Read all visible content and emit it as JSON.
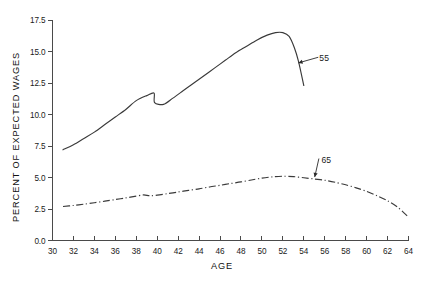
{
  "chart_data": {
    "type": "line",
    "title": "",
    "xlabel": "AGE",
    "ylabel": "PERCENT OF EXPECTED WAGES",
    "xlim": [
      30,
      64
    ],
    "ylim": [
      0.0,
      17.5
    ],
    "xticks": [
      30,
      32,
      34,
      36,
      38,
      40,
      42,
      44,
      46,
      48,
      50,
      52,
      54,
      56,
      58,
      60,
      62,
      64
    ],
    "xticklabels": [
      "30",
      "32",
      "34",
      "36",
      "38",
      "40",
      "42",
      "44",
      "46",
      "48",
      "50",
      "52",
      "54",
      "56",
      "58",
      "60",
      "62",
      "64"
    ],
    "yticks": [
      0.0,
      2.5,
      5.0,
      7.5,
      10.0,
      12.5,
      15.0,
      17.5
    ],
    "yticklabels": [
      "0.0",
      "2.5",
      "5.0",
      "7.5",
      "10.0",
      "12.5",
      "15.0",
      "17.5"
    ],
    "grid": false,
    "legend": "none",
    "series": [
      {
        "name": "55",
        "style": "solid",
        "label": "55",
        "x": [
          31.0,
          32.0,
          33.0,
          34.0,
          35.0,
          36.0,
          37.0,
          38.0,
          39.0,
          39.7,
          39.75,
          40.6,
          41.5,
          42.5,
          43.5,
          44.5,
          45.5,
          46.5,
          47.5,
          48.5,
          49.5,
          50.5,
          51.3,
          52.0,
          52.6,
          53.1,
          53.5,
          54.0
        ],
        "y": [
          7.2,
          7.6,
          8.1,
          8.6,
          9.2,
          9.8,
          10.4,
          11.1,
          11.5,
          11.7,
          10.95,
          10.8,
          11.3,
          11.9,
          12.5,
          13.1,
          13.7,
          14.3,
          14.9,
          15.4,
          15.9,
          16.3,
          16.5,
          16.5,
          16.2,
          15.3,
          14.2,
          12.3
        ]
      },
      {
        "name": "65",
        "style": "dashdot",
        "label": "65",
        "x": [
          31.0,
          32.0,
          33.0,
          34.0,
          35.0,
          36.0,
          37.0,
          38.0,
          38.7,
          39.3,
          40.0,
          41.0,
          42.0,
          43.0,
          44.0,
          45.0,
          46.0,
          47.0,
          48.0,
          49.0,
          50.0,
          51.0,
          52.0,
          53.0,
          54.0,
          55.0,
          56.0,
          57.0,
          58.0,
          59.0,
          60.0,
          61.0,
          62.0,
          63.0,
          64.0
        ],
        "y": [
          2.7,
          2.78,
          2.88,
          3.0,
          3.12,
          3.25,
          3.38,
          3.52,
          3.62,
          3.55,
          3.6,
          3.72,
          3.85,
          3.98,
          4.1,
          4.25,
          4.38,
          4.52,
          4.65,
          4.8,
          4.95,
          5.05,
          5.1,
          5.07,
          4.98,
          4.88,
          4.78,
          4.62,
          4.42,
          4.18,
          3.9,
          3.55,
          3.15,
          2.62,
          1.85
        ]
      }
    ],
    "annotations": [
      {
        "text": "55",
        "target_x": 53.3,
        "target_y": 14.05,
        "label_x": 55.2,
        "label_y": 14.5
      },
      {
        "text": "65",
        "target_x": 55.0,
        "target_y": 4.88,
        "label_x": 55.4,
        "label_y": 6.35
      }
    ]
  },
  "axis_titles": {
    "x": "AGE",
    "y": "PERCENT OF EXPECTED WAGES"
  }
}
